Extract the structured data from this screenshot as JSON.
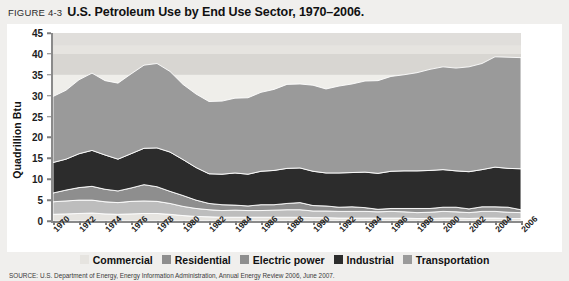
{
  "figure": {
    "number": "FIGURE 4-3",
    "title": "U.S. Petroleum Use by End Use Sector, 1970–2006.",
    "source": "SOURCE: U.S. Department of Energy, Energy Information Administration, Annual Energy Review 2006, June 2007."
  },
  "legend": {
    "items": [
      {
        "label": "Commercial",
        "color": "#e6e4e0"
      },
      {
        "label": "Residential",
        "color": "#8e8e8e"
      },
      {
        "label": "Electric power",
        "color": "#8e8e8e"
      },
      {
        "label": "Industrial",
        "color": "#2c2c2c"
      },
      {
        "label": "Transportation",
        "color": "#9a9a9a"
      }
    ]
  },
  "chart_data": {
    "type": "area",
    "stacked": true,
    "title": "U.S. Petroleum Use by End Use Sector, 1970–2006.",
    "xlabel": "",
    "ylabel": "Quadrillion Btu",
    "ylim": [
      0,
      45
    ],
    "ytick_step": 5,
    "yticks": [
      0,
      5,
      10,
      15,
      20,
      25,
      30,
      35,
      40,
      45
    ],
    "xlim": [
      1970,
      2006
    ],
    "xticks": [
      1970,
      1972,
      1974,
      1976,
      1978,
      1980,
      1982,
      1984,
      1986,
      1988,
      1990,
      1992,
      1994,
      1996,
      1998,
      2000,
      2002,
      2004,
      2006
    ],
    "grid": false,
    "legend_position": "bottom",
    "x": [
      1970,
      1971,
      1972,
      1973,
      1974,
      1975,
      1976,
      1977,
      1978,
      1979,
      1980,
      1981,
      1982,
      1983,
      1984,
      1985,
      1986,
      1987,
      1988,
      1989,
      1990,
      1991,
      1992,
      1993,
      1994,
      1995,
      1996,
      1997,
      1998,
      1999,
      2000,
      2001,
      2002,
      2003,
      2004,
      2005,
      2006
    ],
    "series": [
      {
        "name": "Commercial",
        "color": "#e6e4e0",
        "values": [
          1.6,
          1.7,
          1.8,
          1.9,
          1.7,
          1.6,
          1.7,
          1.8,
          1.8,
          1.6,
          1.3,
          1.1,
          1.0,
          0.9,
          0.9,
          0.9,
          0.9,
          0.9,
          0.9,
          0.9,
          0.8,
          0.8,
          0.7,
          0.7,
          0.7,
          0.7,
          0.7,
          0.7,
          0.6,
          0.6,
          0.7,
          0.7,
          0.6,
          0.7,
          0.7,
          0.6,
          0.6
        ]
      },
      {
        "name": "Residential",
        "color": "#bdbdbd",
        "values": [
          3.0,
          3.1,
          3.2,
          3.1,
          2.9,
          2.8,
          3.0,
          3.0,
          2.9,
          2.6,
          2.2,
          1.9,
          1.7,
          1.6,
          1.7,
          1.6,
          1.6,
          1.7,
          1.8,
          1.8,
          1.6,
          1.6,
          1.6,
          1.6,
          1.6,
          1.5,
          1.6,
          1.5,
          1.4,
          1.5,
          1.6,
          1.5,
          1.4,
          1.6,
          1.6,
          1.5,
          1.4
        ]
      },
      {
        "name": "Electric power",
        "color": "#8e8e8e",
        "values": [
          2.1,
          2.6,
          3.0,
          3.3,
          3.0,
          2.8,
          3.2,
          3.9,
          3.5,
          2.9,
          2.6,
          2.0,
          1.5,
          1.4,
          1.2,
          1.1,
          1.4,
          1.3,
          1.5,
          1.7,
          1.3,
          1.2,
          1.0,
          1.1,
          0.9,
          0.6,
          0.7,
          0.8,
          1.0,
          0.9,
          1.0,
          1.1,
          0.9,
          1.1,
          1.1,
          1.2,
          0.7
        ]
      },
      {
        "name": "Industrial",
        "color": "#2c2c2c",
        "values": [
          7.3,
          7.4,
          8.1,
          8.6,
          8.2,
          7.6,
          8.2,
          8.7,
          9.3,
          9.4,
          8.6,
          7.8,
          7.1,
          7.3,
          7.7,
          7.6,
          8.0,
          8.2,
          8.4,
          8.3,
          8.2,
          7.9,
          8.2,
          8.2,
          8.5,
          8.6,
          8.9,
          9.0,
          9.0,
          9.1,
          9.0,
          8.7,
          8.9,
          8.9,
          9.5,
          9.3,
          9.8
        ]
      },
      {
        "name": "Transportation",
        "color": "#9a9a9a",
        "values": [
          15.8,
          16.5,
          17.7,
          18.5,
          17.8,
          18.2,
          19.1,
          19.9,
          20.2,
          19.3,
          18.0,
          17.6,
          17.3,
          17.5,
          17.9,
          18.3,
          18.9,
          19.4,
          20.1,
          20.1,
          20.6,
          20.1,
          20.8,
          21.2,
          21.8,
          22.2,
          22.7,
          23.0,
          23.5,
          24.2,
          24.6,
          24.6,
          25.1,
          25.4,
          26.4,
          26.6,
          26.6
        ]
      }
    ],
    "totals": [
      29.8,
      31.3,
      33.8,
      35.4,
      33.6,
      33.0,
      35.2,
      37.3,
      37.7,
      35.8,
      32.7,
      30.4,
      28.6,
      28.7,
      29.4,
      29.5,
      30.8,
      31.5,
      32.7,
      32.8,
      32.5,
      31.6,
      32.3,
      32.8,
      33.5,
      33.6,
      34.6,
      35.0,
      35.5,
      36.3,
      36.9,
      36.6,
      36.9,
      37.7,
      39.3,
      39.2,
      39.1
    ]
  }
}
